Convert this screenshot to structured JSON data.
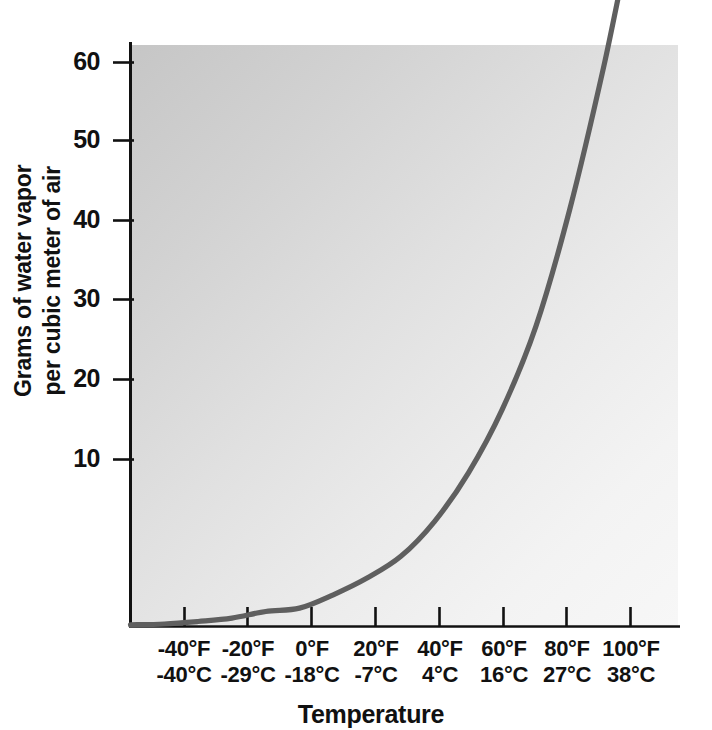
{
  "chart_data": {
    "type": "line",
    "title": "",
    "xlabel": "Temperature",
    "ylabel": "Grams of water vapor per cubic meter of air",
    "ylabel_line1": "Grams of water vapor",
    "ylabel_line2": "per cubic meter of air",
    "ylim": [
      0,
      63
    ],
    "xlim_f": [
      -50,
      112
    ],
    "grid": false,
    "legend": null,
    "series_name": "Saturation water vapor capacity",
    "series_color": "#5f5f5f",
    "background_top_left": "#c6c6c6",
    "background_bottom_right": "#f7f7f7",
    "axis_color": "#111111",
    "ytick_labels": [
      "60",
      "50",
      "40",
      "30",
      "20",
      "10"
    ],
    "ytick_values": [
      60,
      50,
      40,
      30,
      20,
      10
    ],
    "xtick_labels_f": [
      "-40°F",
      "-20°F",
      "0°F",
      "20°F",
      "40°F",
      "60°F",
      "80°F",
      "100°F"
    ],
    "xtick_labels_c": [
      "-40°C",
      "-29°C",
      "-18°C",
      "-7°C",
      "4°C",
      "16°C",
      "27°C",
      "38°C"
    ],
    "xtick_values_f": [
      -40,
      -20,
      0,
      20,
      40,
      60,
      80,
      100
    ],
    "xtick_values_c": [
      -40,
      -29,
      -18,
      -7,
      4,
      16,
      27,
      38
    ],
    "x_f": [
      -50,
      -40,
      -30,
      -20,
      -10,
      0,
      10,
      20,
      30,
      40,
      50,
      60,
      70,
      80,
      90,
      100,
      110
    ],
    "values": [
      0.1,
      0.15,
      0.3,
      0.5,
      0.9,
      1.1,
      1.9,
      2.9,
      4.2,
      6.3,
      9.2,
      13.0,
      18.0,
      25.0,
      33.5,
      43.0,
      49.8
    ],
    "units": "grams per cubic meter"
  },
  "axis_titles": {
    "x": "Temperature",
    "y_line1": "Grams of water vapor",
    "y_line2": "per cubic meter of air"
  }
}
